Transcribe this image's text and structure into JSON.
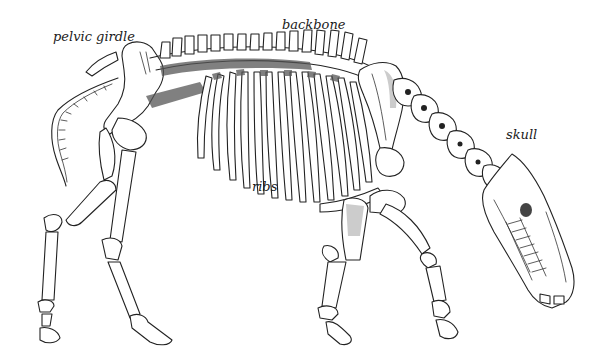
{
  "figure": {
    "background_color": "#ffffff",
    "ink_color": "#222222",
    "labels": {
      "pelvic_girdle": "pelvic girdle",
      "backbone": "backbone",
      "skull": "skull",
      "ribs": "ribs"
    }
  }
}
